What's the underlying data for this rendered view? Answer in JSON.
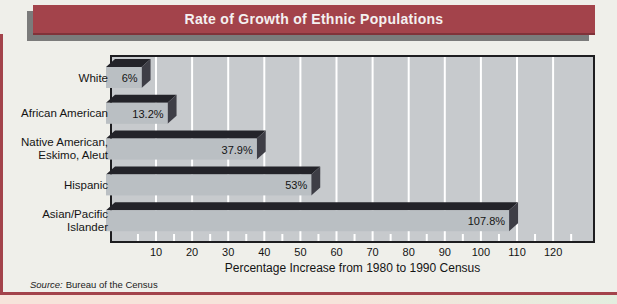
{
  "title_bar": {
    "text": "Rate of Growth of Ethnic Populations"
  },
  "source_note": {
    "prefix": "Source:",
    "text": "Bureau of the Census"
  },
  "chart_data": {
    "type": "bar",
    "orientation": "horizontal",
    "style_3d": true,
    "title": "Rate of Growth of Ethnic Populations",
    "categories": [
      "White",
      "African American",
      "Native American, Eskimo, Aleut",
      "Hispanic",
      "Asian/Pacific Islander"
    ],
    "category_label_lines": [
      [
        "White"
      ],
      [
        "African American"
      ],
      [
        "Native American,",
        "Eskimo, Aleut"
      ],
      [
        "Hispanic"
      ],
      [
        "Asian/Pacific",
        "Islander"
      ]
    ],
    "values": [
      6,
      13.2,
      37.9,
      53,
      107.8
    ],
    "value_labels": [
      "6%",
      "13.2%",
      "37.9%",
      "53%",
      "107.8%"
    ],
    "xlabel": "Percentage Increase from 1980 to 1990 Census",
    "x_ticks": [
      10,
      20,
      30,
      40,
      50,
      60,
      70,
      80,
      90,
      100,
      110,
      120
    ],
    "x_minor_tick_step": 5,
    "xlim": [
      0,
      131
    ],
    "grid": {
      "major": "full-height vertical white gridlines every 10 units",
      "minor": "short white ticks every 5 units along bottom edge"
    },
    "legend": null,
    "colors": {
      "accent_maroon": "#A3434B",
      "title_text": "#F4F1F1",
      "title_shadow": "#7B7B7B",
      "page_bg": "#EFEFEA",
      "plot_bg": "#C7CACD",
      "plot_border": "#1D1D20",
      "grid_line": "#FFFFFF",
      "bar_face": "#BABFC3",
      "bar_top": "#232329",
      "bar_side": "#3E3E46",
      "text": "#141414",
      "strip_left": "#F6E4DB",
      "strip_right": "#E3EEDF"
    }
  }
}
